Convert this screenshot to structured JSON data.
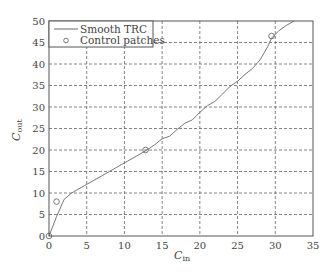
{
  "chart_data": {
    "type": "line",
    "title": "",
    "xlabel": "C_in",
    "xlabel_main": "C",
    "xlabel_sub": "in",
    "ylabel": "C_out",
    "ylabel_main": "C",
    "ylabel_sub": "out",
    "xlim": [
      0,
      35
    ],
    "ylim": [
      0,
      50
    ],
    "xticks": [
      0,
      5,
      10,
      15,
      20,
      25,
      30,
      35
    ],
    "yticks": [
      0,
      5,
      10,
      15,
      20,
      25,
      30,
      35,
      40,
      45,
      50
    ],
    "grid": true,
    "grid_style": "dashed",
    "legend_position": "upper left",
    "legend": [
      "Smooth TRC",
      "Control patches"
    ],
    "series": [
      {
        "name": "Smooth TRC",
        "style": "line",
        "color": "#777777",
        "x": [
          0,
          1,
          2,
          3,
          5,
          7,
          9,
          11,
          12.8,
          14,
          15,
          16,
          17,
          18,
          19,
          20,
          21,
          22,
          23,
          24,
          25,
          26,
          27,
          28,
          29,
          29.5,
          30.5,
          31.5,
          32.5
        ],
        "y": [
          0,
          4.5,
          8.5,
          10,
          12,
          14,
          16,
          18,
          19.8,
          21.2,
          22.6,
          23.2,
          24.8,
          26.2,
          27,
          28.8,
          30.3,
          31.3,
          33,
          34.8,
          36,
          37.6,
          39,
          41,
          44,
          46,
          47.8,
          49,
          50
        ]
      },
      {
        "name": "Control patches",
        "style": "marker-circle",
        "color": "#777777",
        "x": [
          0,
          1,
          12.8,
          29.5
        ],
        "y": [
          0,
          8,
          20,
          46.5
        ]
      }
    ]
  }
}
